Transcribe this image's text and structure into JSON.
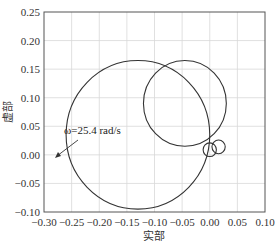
{
  "chart_data": {
    "type": "line",
    "title": "",
    "xlabel": "实部",
    "ylabel": "虚部",
    "xlim": [
      -0.3,
      0.1
    ],
    "ylim": [
      -0.1,
      0.25
    ],
    "grid": true,
    "legend": null,
    "x_ticks": [
      "-0.30",
      "-0.25",
      "-0.20",
      "-0.15",
      "-0.10",
      "-0.05",
      "0.00",
      "0.05",
      "0.10"
    ],
    "y_ticks": [
      "0.25",
      "0.20",
      "0.15",
      "0.10",
      "0.05",
      "0.00",
      "-0.05",
      "-0.10"
    ],
    "annotations": [
      {
        "text": "ω=25.4 rad/s",
        "xy": [
          -0.245,
          0.005
        ],
        "text_xy": [
          -0.23,
          0.045
        ]
      }
    ],
    "series": [
      {
        "name": "large-circle",
        "shape": "circle",
        "center": [
          -0.13,
          0.035
        ],
        "radius": 0.13
      },
      {
        "name": "second-circle",
        "shape": "circle",
        "center": [
          -0.045,
          0.09
        ],
        "radius": 0.075
      },
      {
        "name": "small-loop-1",
        "shape": "circle",
        "center": [
          0.0,
          0.009
        ],
        "radius": 0.012
      },
      {
        "name": "small-loop-2",
        "shape": "circle",
        "center": [
          0.016,
          0.014
        ],
        "radius": 0.012
      }
    ]
  },
  "labels": {
    "xlabel": "实部",
    "ylabel": "虚部",
    "annotation": "ω=25.4 rad/s",
    "x_ticks": [
      "−0.30",
      "−0.25",
      "−0.20",
      "−0.15",
      "−0.10",
      "−0.05",
      "0.00",
      "0.05",
      "0.10"
    ],
    "y_ticks": [
      "0.25",
      "0.20",
      "0.15",
      "0.10",
      "0.05",
      "0.00",
      "−0.05",
      "−0.10"
    ]
  }
}
